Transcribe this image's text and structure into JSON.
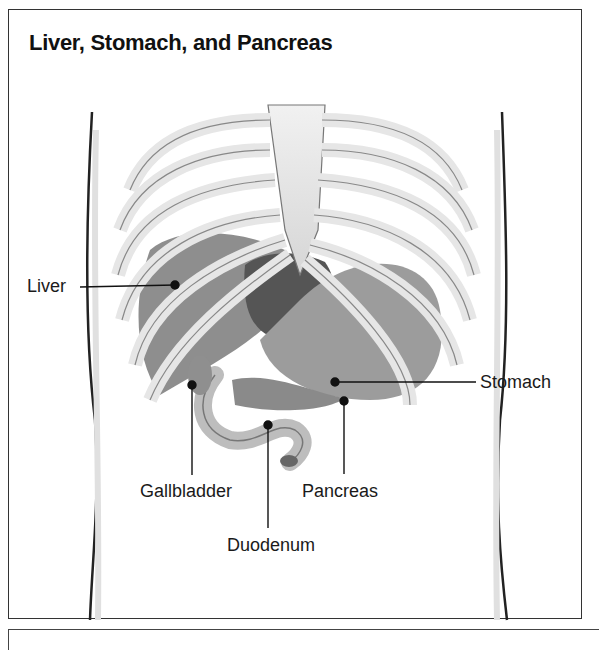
{
  "figure": {
    "title": "Liver, Stomach, and Pancreas",
    "labels": {
      "liver": "Liver",
      "stomach": "Stomach",
      "gallbladder": "Gallbladder",
      "pancreas": "Pancreas",
      "duodenum": "Duodenum"
    }
  }
}
